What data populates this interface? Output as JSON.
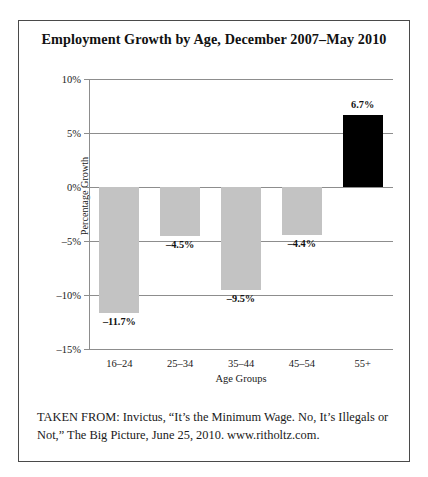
{
  "figure": {
    "title": "Employment Growth by Age, December 2007–May 2010",
    "source_caption": "TAKEN FROM: Invictus, “It’s the Minimum Wage. No, It’s Illegals or Not,” The Big Picture, June 25, 2010. www.ritholtz.com."
  },
  "chart_data": {
    "type": "bar",
    "title": "Employment Growth by Age, December 2007–May 2010",
    "xlabel": "Age Groups",
    "ylabel": "Percentage Growth",
    "categories": [
      "16–24",
      "25–34",
      "35–44",
      "45–54",
      "55+"
    ],
    "values": [
      -11.7,
      -4.5,
      -9.5,
      -4.4,
      6.7
    ],
    "data_labels": [
      "–11.7%",
      "–4.5%",
      "–9.5%",
      "–4.4%",
      "6.7%"
    ],
    "bar_colors": [
      "#c3c3c3",
      "#c3c3c3",
      "#c3c3c3",
      "#c3c3c3",
      "#000000"
    ],
    "ylim": [
      -15,
      10
    ],
    "yticks": [
      10,
      5,
      0,
      -5,
      -10,
      -15
    ],
    "ytick_labels": [
      "10%",
      "5%",
      "0%",
      "–5%",
      "–10%",
      "–15%"
    ],
    "grid": true,
    "legend": false
  },
  "colors": {
    "negative_bar": "#c3c3c3",
    "positive_bar": "#000000",
    "gridline": "#8d8d8d",
    "border": "#4a4a4a"
  }
}
